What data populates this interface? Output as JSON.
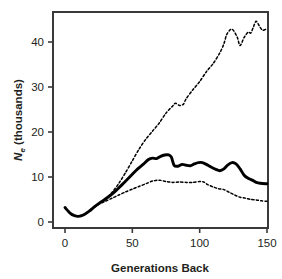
{
  "chart_data": {
    "type": "line",
    "title": "",
    "xlabel": "Generations Back",
    "ylabel": "Ne (thousands)",
    "ylabel_parts": {
      "symbol": "N",
      "subscript": "e",
      "rest": " (thousands)"
    },
    "xlim": [
      0,
      155
    ],
    "ylim": [
      0,
      46
    ],
    "grid": false,
    "legend": "none",
    "xticks": [
      0,
      50,
      100,
      150
    ],
    "yticks": [
      0,
      10,
      20,
      30,
      40
    ],
    "xtick_labels": [
      "0",
      "50",
      "100",
      "150"
    ],
    "ytick_labels": [
      "0",
      "10",
      "20",
      "30",
      "40"
    ],
    "series": [
      {
        "name": "Upper confidence limit",
        "style": "dashed",
        "color": "#000000",
        "x": [
          0,
          5,
          10,
          15,
          20,
          25,
          30,
          35,
          40,
          45,
          50,
          55,
          60,
          65,
          70,
          75,
          80,
          82,
          85,
          88,
          90,
          95,
          100,
          105,
          110,
          115,
          118,
          120,
          123,
          125,
          128,
          130,
          133,
          136,
          138,
          140,
          142,
          145,
          147,
          150
        ],
        "y": [
          3.2,
          1.6,
          1.3,
          1.8,
          2.9,
          4.0,
          5.0,
          6.6,
          8.6,
          11.0,
          13.6,
          16.2,
          18.4,
          20.2,
          22.0,
          24.2,
          25.8,
          26.4,
          25.9,
          26.2,
          27.4,
          29.4,
          31.2,
          33.4,
          35.2,
          37.6,
          39.6,
          41.6,
          42.8,
          42.6,
          41.0,
          39.2,
          41.0,
          42.2,
          42.0,
          43.4,
          44.6,
          43.2,
          42.6,
          43.0
        ]
      },
      {
        "name": "Point estimate",
        "style": "solid",
        "color": "#000000",
        "x": [
          0,
          4,
          7,
          10,
          14,
          18,
          22,
          26,
          30,
          34,
          38,
          42,
          46,
          50,
          54,
          58,
          62,
          65,
          68,
          71,
          74,
          77,
          79,
          81,
          84,
          87,
          90,
          93,
          96,
          99,
          102,
          105,
          108,
          112,
          115,
          118,
          121,
          124,
          127,
          130,
          133,
          136,
          139,
          142,
          145,
          150
        ],
        "y": [
          3.2,
          1.9,
          1.4,
          1.25,
          1.6,
          2.4,
          3.4,
          4.3,
          5.1,
          6.0,
          7.0,
          8.2,
          9.4,
          10.6,
          11.8,
          12.8,
          13.9,
          14.2,
          14.1,
          14.6,
          14.9,
          14.9,
          14.4,
          12.6,
          12.4,
          12.8,
          12.6,
          12.5,
          12.9,
          13.2,
          13.2,
          12.8,
          12.3,
          11.7,
          11.4,
          11.8,
          12.7,
          13.2,
          12.9,
          11.8,
          10.4,
          9.7,
          9.3,
          8.8,
          8.6,
          8.5
        ]
      },
      {
        "name": "Lower confidence limit",
        "style": "dashed",
        "color": "#000000",
        "x": [
          0,
          5,
          10,
          15,
          20,
          25,
          30,
          35,
          40,
          45,
          50,
          55,
          60,
          65,
          70,
          75,
          80,
          85,
          90,
          95,
          100,
          103,
          106,
          110,
          114,
          118,
          122,
          126,
          130,
          134,
          138,
          142,
          146,
          150
        ],
        "y": [
          3.2,
          1.6,
          1.3,
          1.8,
          2.9,
          3.9,
          4.6,
          5.3,
          6.0,
          6.7,
          7.3,
          7.9,
          8.5,
          9.1,
          9.3,
          9.0,
          8.8,
          8.9,
          8.8,
          8.8,
          9.0,
          8.9,
          8.3,
          7.8,
          7.4,
          7.2,
          6.6,
          6.0,
          5.5,
          5.3,
          5.0,
          4.9,
          4.7,
          4.6
        ]
      }
    ]
  }
}
